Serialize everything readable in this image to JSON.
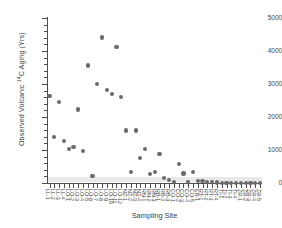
{
  "chart_data": {
    "type": "scatter",
    "title": "",
    "xlabel": "Sampling Site",
    "ylabel": "Observed Volcanic 14C Aging (Yrs)",
    "ylabel_prefix": "Observed Volcanic ",
    "ylabel_superscript": "14",
    "ylabel_suffix": "C Aging (Yrs)",
    "ylim": [
      0,
      5000
    ],
    "ytick_values": [
      0,
      1000,
      2000,
      3000,
      4000,
      5000
    ],
    "ytick_labels": [
      "0",
      "1000",
      "2000",
      "3000",
      "4000",
      "5000"
    ],
    "grid": false,
    "legend": false,
    "marker_color": "#6b6b6b",
    "axis_color": "#4d4d4d",
    "categories": [
      "LL-1",
      "LL-2",
      "LL-3",
      "LL-4",
      "LO-1",
      "LO-2",
      "LO-3",
      "LO-4",
      "LO-5",
      "LO-6",
      "LO-7",
      "LO-8",
      "LO-9",
      "LO-10",
      "LO-11",
      "LO-12",
      "NZ-1",
      "NZ-2",
      "NZ-3",
      "NZ-4",
      "RN-1",
      "RN-2",
      "RN-3",
      "RB-1",
      "RB-2",
      "RB-3",
      "CO-1",
      "CO-2",
      "CO-3",
      "CO-4",
      "CO-5",
      "ER-1",
      "RT-1",
      "RT-2",
      "RT-3",
      "RT-4",
      "TI-1",
      "TI-2",
      "TI-3",
      "TI-4",
      "ZR-1",
      "ZR-2",
      "ZR-3",
      "ZR-4",
      "ZR-5"
    ],
    "values": [
      2640,
      1390,
      2450,
      1280,
      1040,
      1080,
      2230,
      975,
      3560,
      220,
      2990,
      4410,
      2830,
      2700,
      4130,
      2600,
      1590,
      340,
      1590,
      760,
      1040,
      280,
      340,
      870,
      150,
      95,
      20,
      580,
      290,
      30,
      340,
      55,
      60,
      25,
      20,
      15,
      12,
      10,
      10,
      8,
      8,
      6,
      6,
      5,
      5
    ]
  }
}
